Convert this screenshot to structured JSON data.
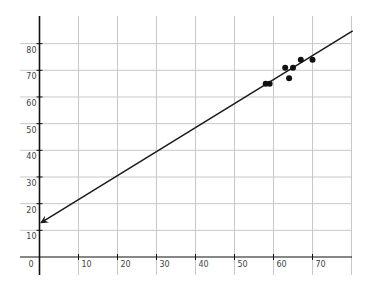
{
  "chart_data": {
    "type": "scatter",
    "title": "",
    "xlabel": "",
    "ylabel": "",
    "xlim": [
      0,
      80
    ],
    "ylim": [
      0,
      85
    ],
    "grid": true,
    "legend": null,
    "x_ticks": [
      0,
      10,
      20,
      30,
      40,
      50,
      60,
      70
    ],
    "y_ticks": [
      10,
      20,
      30,
      40,
      50,
      60,
      70,
      80
    ],
    "x_tick_labels": [
      "0",
      "10",
      "20",
      "30",
      "40",
      "50",
      "60",
      "70"
    ],
    "y_tick_labels": [
      "10",
      "20",
      "30",
      "40",
      "50",
      "60",
      "70",
      "80"
    ],
    "points": [
      {
        "x": 58,
        "y": 65
      },
      {
        "x": 59,
        "y": 65
      },
      {
        "x": 63,
        "y": 71
      },
      {
        "x": 64,
        "y": 67
      },
      {
        "x": 65,
        "y": 71
      },
      {
        "x": 67,
        "y": 74
      },
      {
        "x": 70,
        "y": 74
      }
    ],
    "trend_line": {
      "slope": 0.9,
      "intercept": 12.5,
      "x_start": 0,
      "x_end": 80.3,
      "arrow_at_start": true,
      "color": "#1a1a1a"
    },
    "colors": {
      "axis": "#111111",
      "grid": "#c8c8c8",
      "points": "#111111"
    }
  }
}
